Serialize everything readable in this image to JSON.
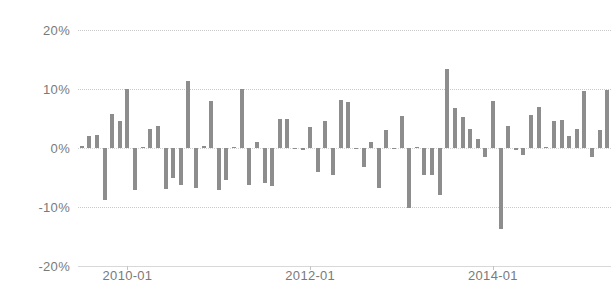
{
  "chart_data": {
    "type": "bar",
    "title": "",
    "subtitle": "",
    "xlabel": "",
    "ylabel": "",
    "ylim": [
      -20,
      20
    ],
    "ytick_values": [
      20,
      10,
      0,
      -10,
      -20
    ],
    "ytick_labels": [
      "20%",
      "10%",
      "0%",
      "-10%",
      "-20%"
    ],
    "xtick_labels": [
      "2010-01",
      "2012-01",
      "2014-01"
    ],
    "xtick_categories": [
      "2010-01",
      "2012-01",
      "2014-01"
    ],
    "grid": true,
    "legend": false,
    "legend_position": "none",
    "bar_color": "#8d8d8d",
    "grid_color": "#c9c9c9",
    "axis_text_color": "#7a7a7a",
    "background_color": "#ffffff",
    "categories": [
      "2009-07",
      "2009-08",
      "2009-09",
      "2009-10",
      "2009-11",
      "2009-12",
      "2010-01",
      "2010-02",
      "2010-03",
      "2010-04",
      "2010-05",
      "2010-06",
      "2010-07",
      "2010-08",
      "2010-09",
      "2010-10",
      "2010-11",
      "2010-12",
      "2011-01",
      "2011-02",
      "2011-03",
      "2011-04",
      "2011-05",
      "2011-06",
      "2011-07",
      "2011-08",
      "2011-09",
      "2011-10",
      "2011-11",
      "2011-12",
      "2012-01",
      "2012-02",
      "2012-03",
      "2012-04",
      "2012-05",
      "2012-06",
      "2012-07",
      "2012-08",
      "2012-09",
      "2012-10",
      "2012-11",
      "2012-12",
      "2013-01",
      "2013-02",
      "2013-03",
      "2013-04",
      "2013-05",
      "2013-06",
      "2013-07",
      "2013-08",
      "2013-09",
      "2013-10",
      "2013-11",
      "2013-12",
      "2014-01",
      "2014-02",
      "2014-03",
      "2014-04",
      "2014-05",
      "2014-06",
      "2014-07",
      "2014-08",
      "2014-09",
      "2014-10",
      "2014-11",
      "2014-12",
      "2015-01",
      "2015-02",
      "2015-03",
      "2015-04"
    ],
    "values": [
      0.3,
      2.0,
      2.2,
      -8.8,
      5.8,
      4.6,
      10.0,
      -7.2,
      0.2,
      3.2,
      3.8,
      -7.0,
      -5.0,
      -6.2,
      11.3,
      -6.8,
      0.3,
      8.0,
      -7.2,
      -5.4,
      0.2,
      10.0,
      -6.2,
      1.0,
      -6.0,
      -6.4,
      5.0,
      5.0,
      -0.2,
      -0.3,
      3.6,
      -4.0,
      4.6,
      -4.6,
      8.2,
      7.8,
      -0.2,
      -3.2,
      1.0,
      -6.8,
      3.0,
      -0.2,
      5.4,
      -10.2,
      0.2,
      -4.6,
      -4.6,
      -8.0,
      13.4,
      6.8,
      5.2,
      3.2,
      1.6,
      -1.6,
      8.0,
      -13.8,
      3.8,
      -0.3,
      -1.2,
      5.6,
      7.0,
      0.2,
      4.6,
      4.8,
      2.0,
      3.2,
      9.6,
      -1.6,
      3.0,
      9.8
    ]
  }
}
